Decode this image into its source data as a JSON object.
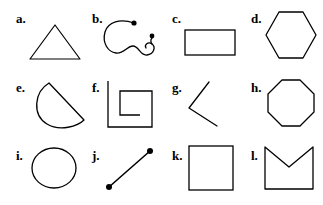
{
  "page": {
    "width": 323,
    "height": 205,
    "background_color": "#ffffff",
    "stroke_color": "#000000"
  },
  "figures": [
    {
      "id": "a",
      "label": "a.",
      "shape_name": "triangle",
      "icon_name": "triangle-shape",
      "row": 1,
      "column": 1
    },
    {
      "id": "b",
      "label": "b.",
      "shape_name": "open curved squiggle with endpoint dots",
      "icon_name": "squiggle-curve-shape",
      "row": 1,
      "column": 2
    },
    {
      "id": "c",
      "label": "c.",
      "shape_name": "rectangle",
      "icon_name": "rectangle-shape",
      "row": 1,
      "column": 3
    },
    {
      "id": "d",
      "label": "d.",
      "shape_name": "hexagon",
      "icon_name": "hexagon-shape",
      "row": 1,
      "column": 4
    },
    {
      "id": "e",
      "label": "e.",
      "shape_name": "half disc with straight diagonal edge",
      "icon_name": "half-disc-shape",
      "row": 2,
      "column": 1
    },
    {
      "id": "f",
      "label": "f.",
      "shape_name": "rectangular spiral",
      "icon_name": "rectangular-spiral-shape",
      "row": 2,
      "column": 2
    },
    {
      "id": "g",
      "label": "g.",
      "shape_name": "angle of two line segments",
      "icon_name": "angle-shape",
      "row": 2,
      "column": 3
    },
    {
      "id": "h",
      "label": "h.",
      "shape_name": "octagon",
      "icon_name": "octagon-shape",
      "row": 2,
      "column": 4
    },
    {
      "id": "i",
      "label": "i.",
      "shape_name": "circle",
      "icon_name": "circle-shape",
      "row": 3,
      "column": 1
    },
    {
      "id": "j",
      "label": "j.",
      "shape_name": "line segment with endpoint dots",
      "icon_name": "line-segment-shape",
      "row": 3,
      "column": 2
    },
    {
      "id": "k",
      "label": "k.",
      "shape_name": "square",
      "icon_name": "square-shape",
      "row": 3,
      "column": 3
    },
    {
      "id": "l",
      "label": "l.",
      "shape_name": "concave pentagon envelope",
      "icon_name": "envelope-polygon-shape",
      "row": 3,
      "column": 4
    }
  ]
}
